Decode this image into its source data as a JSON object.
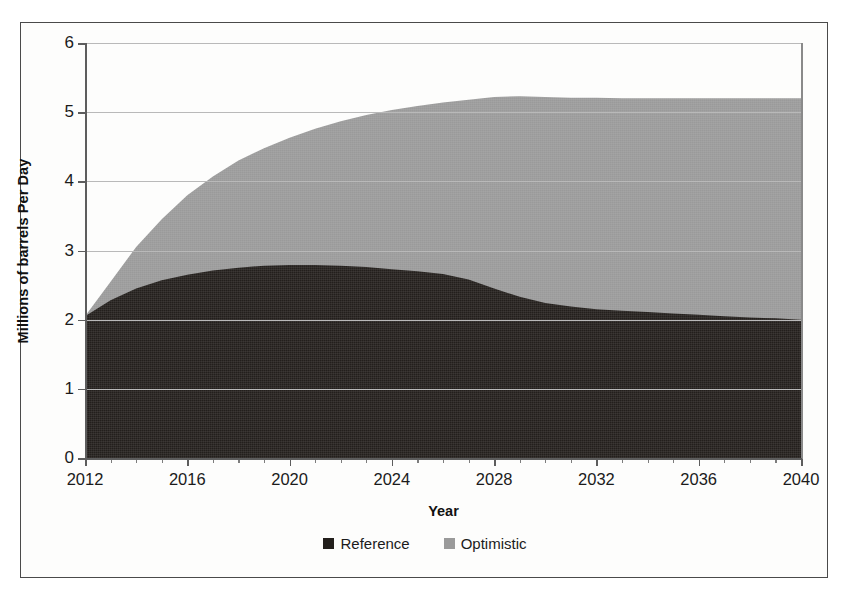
{
  "chart_data": {
    "type": "area",
    "title": "",
    "xlabel": "Year",
    "ylabel": "Millions of barrels Per Day",
    "xlim": [
      2012,
      2040
    ],
    "ylim": [
      0,
      6
    ],
    "grid": true,
    "stacked": false,
    "legend_position": "bottom-center",
    "x_tick_labels": [
      "2012",
      "2016",
      "2020",
      "2024",
      "2028",
      "2032",
      "2036",
      "2040"
    ],
    "x_tick_values": [
      2012,
      2016,
      2020,
      2024,
      2028,
      2032,
      2036,
      2040
    ],
    "x_minor_tick_step": 1,
    "y_tick_labels": [
      "0",
      "1",
      "2",
      "3",
      "4",
      "5",
      "6"
    ],
    "y_tick_values": [
      0,
      1,
      2,
      3,
      4,
      5,
      6
    ],
    "x": [
      2012,
      2013,
      2014,
      2015,
      2016,
      2017,
      2018,
      2019,
      2020,
      2021,
      2022,
      2023,
      2024,
      2025,
      2026,
      2027,
      2028,
      2029,
      2030,
      2031,
      2032,
      2033,
      2034,
      2035,
      2036,
      2037,
      2038,
      2039,
      2040
    ],
    "series": [
      {
        "name": "Optimistic",
        "color": "#9a9a9a",
        "values": [
          2.05,
          2.55,
          3.05,
          3.45,
          3.8,
          4.07,
          4.3,
          4.48,
          4.63,
          4.76,
          4.87,
          4.96,
          5.03,
          5.09,
          5.14,
          5.18,
          5.22,
          5.23,
          5.22,
          5.21,
          5.21,
          5.2,
          5.2,
          5.2,
          5.2,
          5.2,
          5.2,
          5.2,
          5.2
        ]
      },
      {
        "name": "Reference",
        "color": "#231f1c",
        "values": [
          2.05,
          2.28,
          2.45,
          2.57,
          2.65,
          2.71,
          2.75,
          2.78,
          2.79,
          2.79,
          2.78,
          2.76,
          2.73,
          2.7,
          2.66,
          2.58,
          2.45,
          2.33,
          2.24,
          2.19,
          2.15,
          2.13,
          2.11,
          2.09,
          2.07,
          2.05,
          2.03,
          2.02,
          2.0
        ]
      }
    ],
    "legend": [
      {
        "label": "Reference",
        "color": "#231f1c"
      },
      {
        "label": "Optimistic",
        "color": "#9a9a9a"
      }
    ]
  },
  "figure": {
    "border_color": "#4a4a4a",
    "background": "#fdfdfc"
  }
}
